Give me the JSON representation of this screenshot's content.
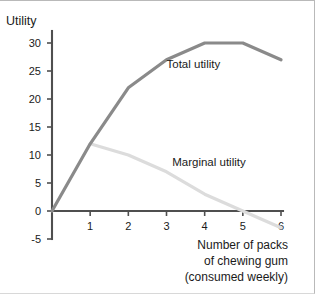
{
  "chart_data": {
    "type": "line",
    "title": "",
    "xlabel": "Number of packs of chewing gum (consumed weekly)",
    "xlabel_lines": [
      "Number of packs",
      "of chewing gum",
      "(consumed weekly)"
    ],
    "ylabel": "Utility",
    "xlim": [
      0,
      6
    ],
    "ylim": [
      -5,
      30
    ],
    "grid": false,
    "legend_position": "inline-annotation",
    "x": [
      0,
      1,
      2,
      3,
      4,
      5,
      6
    ],
    "xticks": [
      "1",
      "2",
      "3",
      "4",
      "5",
      "6"
    ],
    "xtick_values": [
      1,
      2,
      3,
      4,
      5,
      6
    ],
    "yticks": [
      "30",
      "25",
      "20",
      "15",
      "10",
      "5",
      "0",
      "-5"
    ],
    "ytick_values": [
      30,
      25,
      20,
      15,
      10,
      5,
      0,
      -5
    ],
    "series": [
      {
        "name": "Total utility",
        "color": "#8a8a8a",
        "x": [
          0,
          1,
          2,
          3,
          4,
          5,
          6
        ],
        "values": [
          0,
          12,
          22,
          27,
          30,
          30,
          27
        ]
      },
      {
        "name": "Marginal utility",
        "color": "#dcdcdc",
        "x": [
          1,
          2,
          3,
          4,
          5,
          6
        ],
        "values": [
          12,
          10,
          7,
          3,
          0,
          -3
        ]
      }
    ],
    "annotations": [
      {
        "text": "Total utility",
        "x": 3.0,
        "y": 25.5
      },
      {
        "text": "Marginal utility",
        "x": 3.15,
        "y": 8.0
      }
    ]
  },
  "axis": {
    "y_label": "Utility"
  }
}
